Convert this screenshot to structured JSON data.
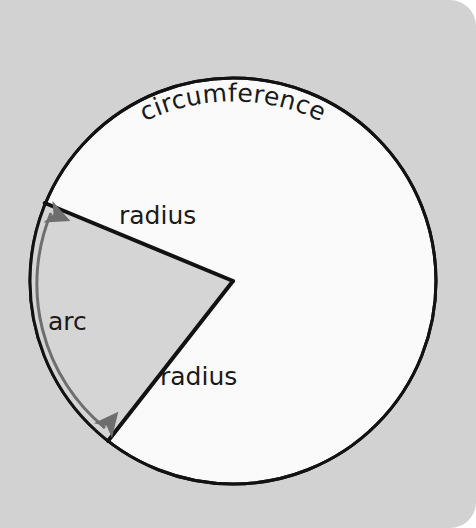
{
  "figure": {
    "type": "circle-sector-diagram",
    "title_label": "circumference",
    "background_color": "#d2d2d2",
    "circle": {
      "fill_color": "#fafafa",
      "stroke_color": "#121212",
      "stroke_width": 3,
      "center_x": 233,
      "center_y": 281,
      "radius": 203
    },
    "sector": {
      "fill_color": "#d5d5d5",
      "stroke_color": "#121212",
      "stroke_width": 4,
      "start_angle_deg": 202,
      "end_angle_deg": 128
    },
    "labels": {
      "circumference": "circumference",
      "radius_upper": "radius",
      "radius_lower": "radius",
      "arc": "arc"
    },
    "arc_arrow": {
      "color": "#6e6e6e",
      "stroke_width": 3,
      "double_headed": true
    }
  }
}
